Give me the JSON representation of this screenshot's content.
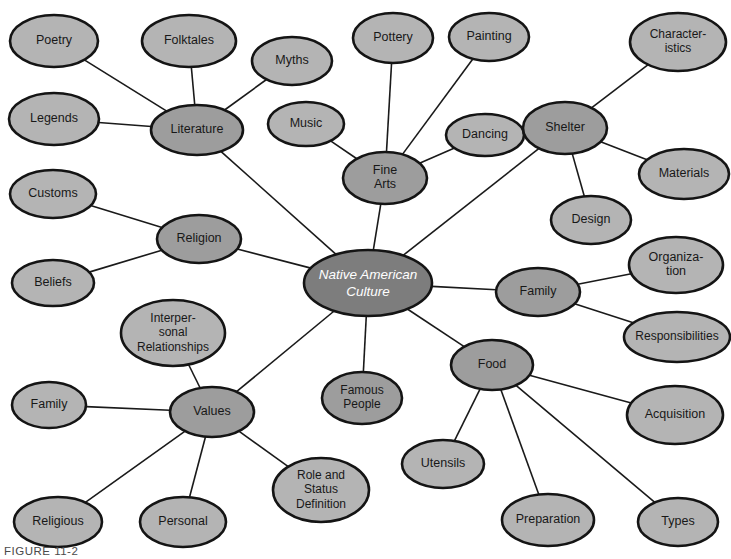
{
  "figure": {
    "caption": "FIGURE 11-2",
    "width": 731,
    "height": 559,
    "background": "#ffffff"
  },
  "colors": {
    "center_fill": "#7d7d7d",
    "branch_fill": "#9d9d9d",
    "leaf_fill": "#b4b4b4",
    "outline": "#141414",
    "edge": "#1a1a1a",
    "center_text": "#ffffff",
    "node_text": "#181818"
  },
  "chart_data": {
    "type": "diagram",
    "diagram_type": "concept-map",
    "center": {
      "id": "center",
      "label": "Native American Culture",
      "lines": [
        "Native American",
        "Culture"
      ],
      "level": 1,
      "cx": 368,
      "cy": 283,
      "rx": 64,
      "ry": 33
    },
    "nodes": [
      {
        "id": "literature",
        "label": "Literature",
        "lines": [
          "Literature"
        ],
        "level": 2,
        "cx": 197,
        "cy": 130,
        "rx": 46,
        "ry": 25
      },
      {
        "id": "poetry",
        "label": "Poetry",
        "lines": [
          "Poetry"
        ],
        "level": 3,
        "cx": 54,
        "cy": 41,
        "rx": 44,
        "ry": 26
      },
      {
        "id": "folktales",
        "label": "Folktales",
        "lines": [
          "Folktales"
        ],
        "level": 3,
        "cx": 189,
        "cy": 41,
        "rx": 47,
        "ry": 26
      },
      {
        "id": "myths",
        "label": "Myths",
        "lines": [
          "Myths"
        ],
        "level": 3,
        "cx": 292,
        "cy": 61,
        "rx": 40,
        "ry": 24
      },
      {
        "id": "legends",
        "label": "Legends",
        "lines": [
          "Legends"
        ],
        "level": 3,
        "cx": 54,
        "cy": 119,
        "rx": 45,
        "ry": 26
      },
      {
        "id": "fine-arts",
        "label": "Fine Arts",
        "lines": [
          "Fine",
          "Arts"
        ],
        "level": 2,
        "cx": 385,
        "cy": 178,
        "rx": 42,
        "ry": 26
      },
      {
        "id": "pottery",
        "label": "Pottery",
        "lines": [
          "Pottery"
        ],
        "level": 3,
        "cx": 393,
        "cy": 38,
        "rx": 40,
        "ry": 25
      },
      {
        "id": "painting",
        "label": "Painting",
        "lines": [
          "Painting"
        ],
        "level": 3,
        "cx": 489,
        "cy": 37,
        "rx": 40,
        "ry": 24
      },
      {
        "id": "music",
        "label": "Music",
        "lines": [
          "Music"
        ],
        "level": 3,
        "cx": 306,
        "cy": 124,
        "rx": 38,
        "ry": 22
      },
      {
        "id": "dancing",
        "label": "Dancing",
        "lines": [
          "Dancing"
        ],
        "level": 3,
        "cx": 485,
        "cy": 135,
        "rx": 39,
        "ry": 21
      },
      {
        "id": "shelter",
        "label": "Shelter",
        "lines": [
          "Shelter"
        ],
        "level": 2,
        "cx": 565,
        "cy": 128,
        "rx": 42,
        "ry": 26
      },
      {
        "id": "characteristics",
        "label": "Characteristics",
        "lines": [
          "Character-",
          "istics"
        ],
        "level": 3,
        "cx": 678,
        "cy": 42,
        "rx": 48,
        "ry": 29
      },
      {
        "id": "materials",
        "label": "Materials",
        "lines": [
          "Materials"
        ],
        "level": 3,
        "cx": 684,
        "cy": 174,
        "rx": 45,
        "ry": 25
      },
      {
        "id": "design",
        "label": "Design",
        "lines": [
          "Design"
        ],
        "level": 3,
        "cx": 591,
        "cy": 220,
        "rx": 40,
        "ry": 24
      },
      {
        "id": "family-right",
        "label": "Family",
        "lines": [
          "Family"
        ],
        "level": 2,
        "cx": 538,
        "cy": 292,
        "rx": 42,
        "ry": 24
      },
      {
        "id": "organization",
        "label": "Organization",
        "lines": [
          "Organiza-",
          "tion"
        ],
        "level": 3,
        "cx": 676,
        "cy": 265,
        "rx": 47,
        "ry": 28
      },
      {
        "id": "responsibilities",
        "label": "Responsibilities",
        "lines": [
          "Responsibilities"
        ],
        "level": 3,
        "cx": 677,
        "cy": 337,
        "rx": 53,
        "ry": 25
      },
      {
        "id": "food",
        "label": "Food",
        "lines": [
          "Food"
        ],
        "level": 2,
        "cx": 492,
        "cy": 365,
        "rx": 41,
        "ry": 25
      },
      {
        "id": "acquisition",
        "label": "Acquisition",
        "lines": [
          "Acquisition"
        ],
        "level": 3,
        "cx": 675,
        "cy": 415,
        "rx": 48,
        "ry": 29
      },
      {
        "id": "utensils",
        "label": "Utensils",
        "lines": [
          "Utensils"
        ],
        "level": 3,
        "cx": 443,
        "cy": 464,
        "rx": 41,
        "ry": 24
      },
      {
        "id": "preparation",
        "label": "Preparation",
        "lines": [
          "Preparation"
        ],
        "level": 3,
        "cx": 548,
        "cy": 520,
        "rx": 46,
        "ry": 26
      },
      {
        "id": "types",
        "label": "Types",
        "lines": [
          "Types"
        ],
        "level": 3,
        "cx": 678,
        "cy": 522,
        "rx": 40,
        "ry": 24
      },
      {
        "id": "religion",
        "label": "Religion",
        "lines": [
          "Religion"
        ],
        "level": 2,
        "cx": 199,
        "cy": 239,
        "rx": 42,
        "ry": 24
      },
      {
        "id": "customs",
        "label": "Customs",
        "lines": [
          "Customs"
        ],
        "level": 3,
        "cx": 53,
        "cy": 194,
        "rx": 43,
        "ry": 24
      },
      {
        "id": "beliefs",
        "label": "Beliefs",
        "lines": [
          "Beliefs"
        ],
        "level": 3,
        "cx": 53,
        "cy": 283,
        "rx": 41,
        "ry": 23
      },
      {
        "id": "values",
        "label": "Values",
        "lines": [
          "Values"
        ],
        "level": 2,
        "cx": 212,
        "cy": 412,
        "rx": 42,
        "ry": 25
      },
      {
        "id": "interpersonal-relationships",
        "label": "Interpersonal Relationships",
        "lines": [
          "Interper-",
          "sonal",
          "Relationships"
        ],
        "level": 3,
        "cx": 173,
        "cy": 333,
        "rx": 52,
        "ry": 33
      },
      {
        "id": "family-left",
        "label": "Family",
        "lines": [
          "Family"
        ],
        "level": 3,
        "cx": 49,
        "cy": 405,
        "rx": 37,
        "ry": 23
      },
      {
        "id": "religious",
        "label": "Religious",
        "lines": [
          "Religious"
        ],
        "level": 3,
        "cx": 58,
        "cy": 522,
        "rx": 44,
        "ry": 25
      },
      {
        "id": "personal",
        "label": "Personal",
        "lines": [
          "Personal"
        ],
        "level": 3,
        "cx": 183,
        "cy": 522,
        "rx": 43,
        "ry": 25
      },
      {
        "id": "role-status",
        "label": "Role and Status Definition",
        "lines": [
          "Role and",
          "Status",
          "Definition"
        ],
        "level": 3,
        "cx": 321,
        "cy": 490,
        "rx": 48,
        "ry": 32
      },
      {
        "id": "famous-people",
        "label": "Famous People",
        "lines": [
          "Famous",
          "People"
        ],
        "level": 2,
        "cx": 362,
        "cy": 398,
        "rx": 40,
        "ry": 26
      }
    ],
    "edges": [
      {
        "from": "center",
        "to": "literature"
      },
      {
        "from": "center",
        "to": "fine-arts"
      },
      {
        "from": "center",
        "to": "shelter"
      },
      {
        "from": "center",
        "to": "family-right"
      },
      {
        "from": "center",
        "to": "food"
      },
      {
        "from": "center",
        "to": "religion"
      },
      {
        "from": "center",
        "to": "values"
      },
      {
        "from": "center",
        "to": "famous-people"
      },
      {
        "from": "literature",
        "to": "poetry"
      },
      {
        "from": "literature",
        "to": "folktales"
      },
      {
        "from": "literature",
        "to": "myths"
      },
      {
        "from": "literature",
        "to": "legends"
      },
      {
        "from": "fine-arts",
        "to": "pottery"
      },
      {
        "from": "fine-arts",
        "to": "painting"
      },
      {
        "from": "fine-arts",
        "to": "music"
      },
      {
        "from": "fine-arts",
        "to": "dancing"
      },
      {
        "from": "shelter",
        "to": "characteristics"
      },
      {
        "from": "shelter",
        "to": "materials"
      },
      {
        "from": "shelter",
        "to": "design"
      },
      {
        "from": "family-right",
        "to": "organization"
      },
      {
        "from": "family-right",
        "to": "responsibilities"
      },
      {
        "from": "food",
        "to": "acquisition"
      },
      {
        "from": "food",
        "to": "utensils"
      },
      {
        "from": "food",
        "to": "preparation"
      },
      {
        "from": "food",
        "to": "types"
      },
      {
        "from": "religion",
        "to": "customs"
      },
      {
        "from": "religion",
        "to": "beliefs"
      },
      {
        "from": "values",
        "to": "interpersonal-relationships"
      },
      {
        "from": "values",
        "to": "family-left"
      },
      {
        "from": "values",
        "to": "religious"
      },
      {
        "from": "values",
        "to": "personal"
      },
      {
        "from": "values",
        "to": "role-status"
      }
    ]
  }
}
